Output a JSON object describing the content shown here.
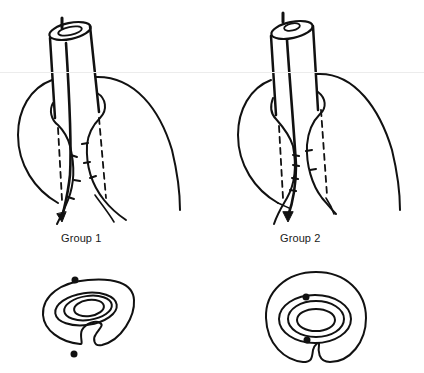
{
  "figure": {
    "panels": [
      {
        "id": "group-1",
        "label": "Group 1",
        "top_view": "tube through tissue fold with sutures, dashed suture tracks on both sides",
        "cross_section": "concentric rings inside C-shaped fold, two suture dots outside (above and below)"
      },
      {
        "id": "group-2",
        "label": "Group 2",
        "top_view": "tube through tissue fold with sutures, dashed suture tracks on both sides",
        "cross_section": "concentric rings inside C-shaped fold, two suture dots inside (top and bottom of inner ring)"
      }
    ],
    "colors": {
      "ink": "#111111",
      "background": "#ffffff"
    }
  }
}
